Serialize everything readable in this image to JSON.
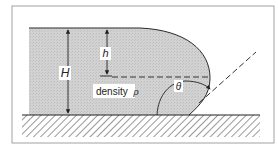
{
  "figure": {
    "labels": {
      "H": "H",
      "h": "h",
      "density": "density",
      "rho": "ρ",
      "theta": "θ"
    },
    "colors": {
      "liquid_fill": "#cfcfcf",
      "stroke": "#2a2a2a",
      "frame": "#8a8a8a",
      "background": "#ffffff"
    }
  }
}
